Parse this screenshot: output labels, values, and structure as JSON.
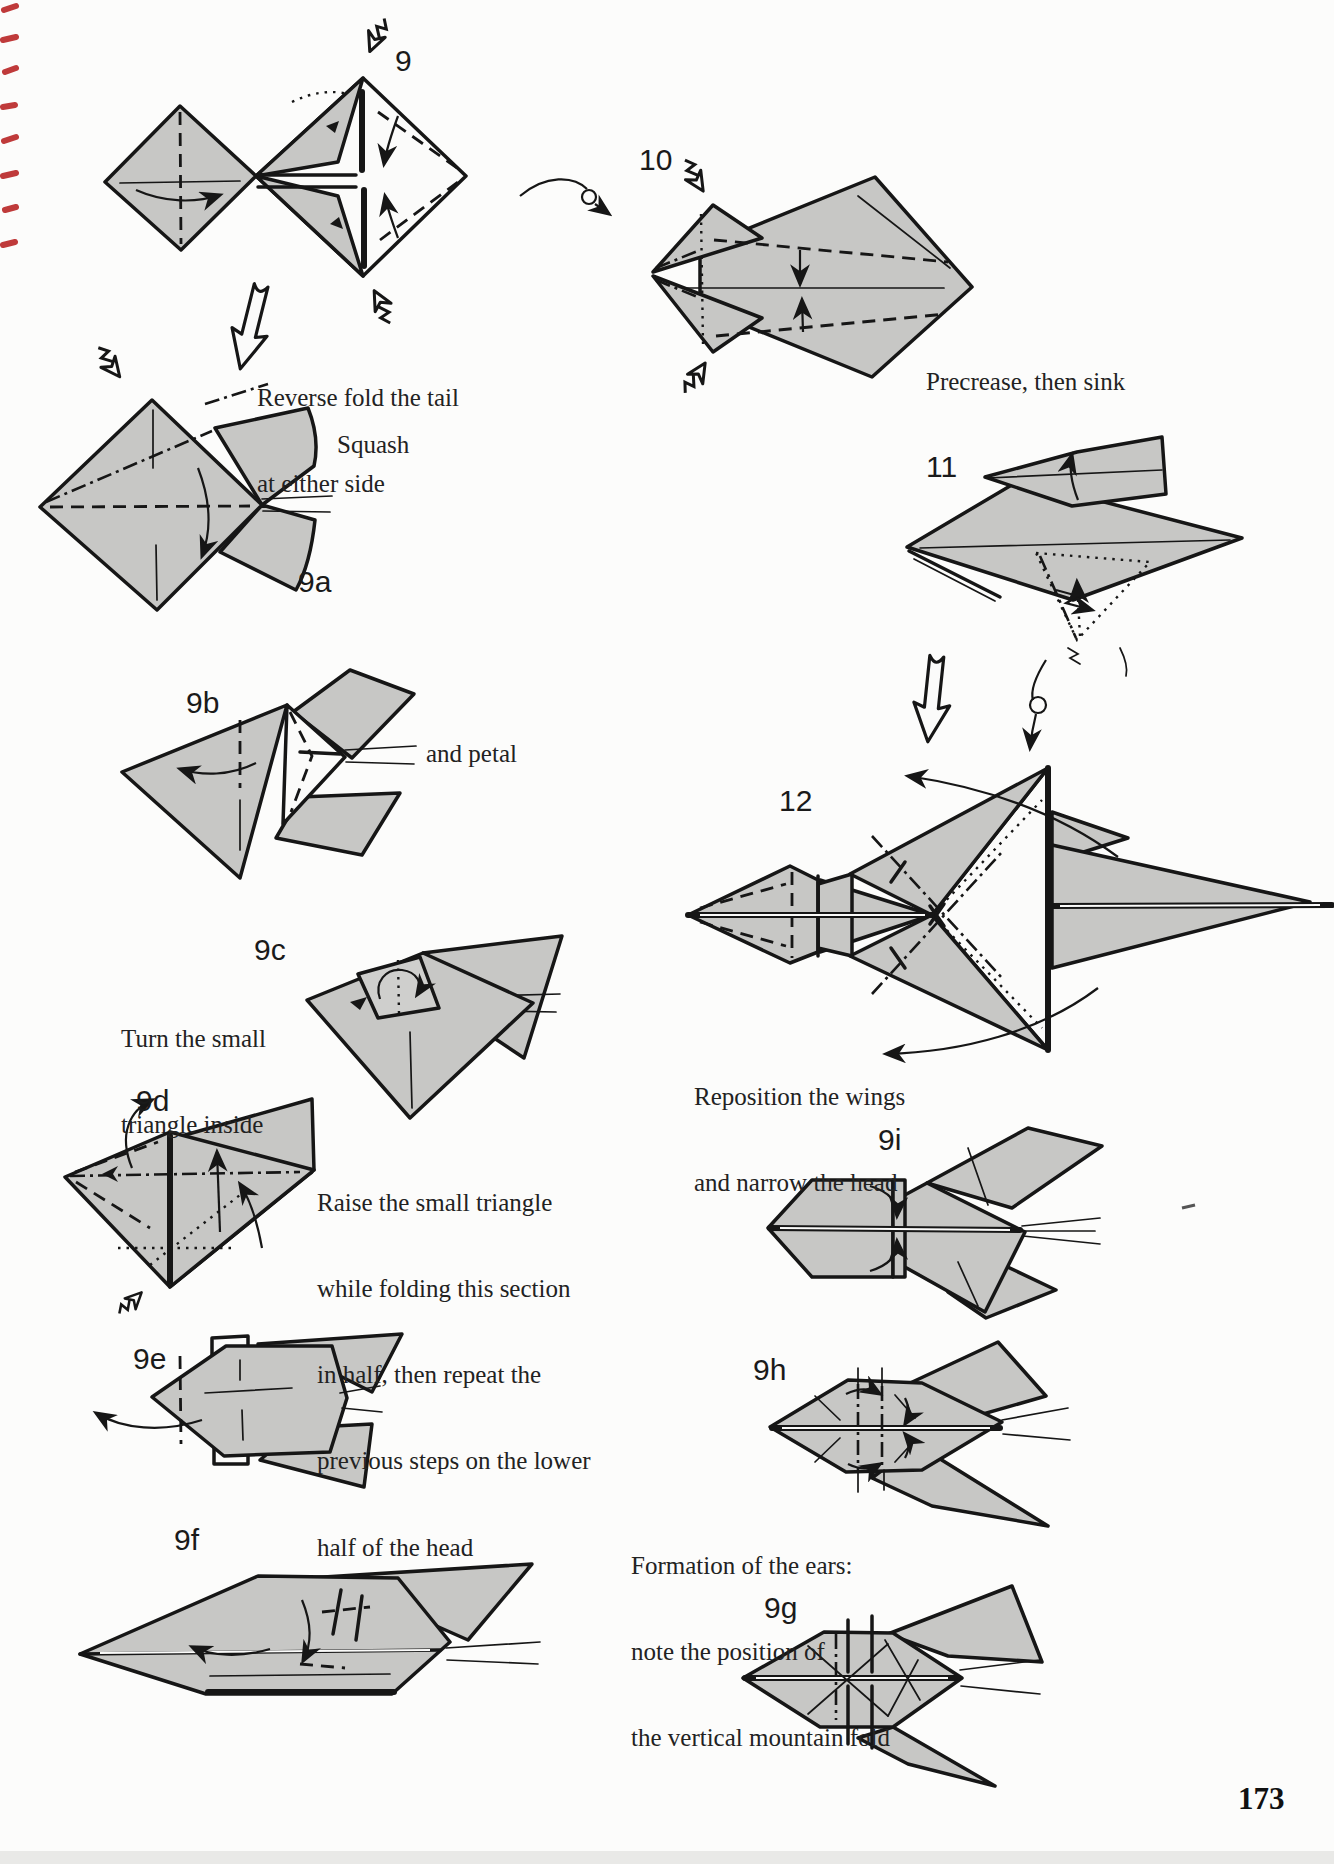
{
  "page": {
    "number": "173"
  },
  "colors": {
    "paper_gray": "#c7c7c5",
    "ink": "#161616",
    "scan_mark_red": "#bf3a3a"
  },
  "steps": {
    "s9": {
      "label": "9",
      "caption_lines": [
        "Reverse fold the tail",
        "at either side"
      ]
    },
    "s9a": {
      "label": "9a",
      "caption": "Squash"
    },
    "s9b": {
      "label": "9b",
      "caption": "and petal"
    },
    "s9c": {
      "label": "9c",
      "caption_lines": [
        "Turn the small",
        "triangle inside"
      ]
    },
    "s9d": {
      "label": "9d",
      "caption_lines": [
        "Raise the small triangle",
        "while folding this section",
        "in half, then repeat the",
        "previous steps on the lower",
        "half of the head"
      ]
    },
    "s9e": {
      "label": "9e"
    },
    "s9f": {
      "label": "9f"
    },
    "s9g": {
      "label": "9g"
    },
    "s9h": {
      "label": "9h",
      "caption_lines": [
        "Formation of the ears:",
        "note the position of",
        "the vertical mountain fold"
      ]
    },
    "s9i": {
      "label": "9i"
    },
    "s10": {
      "label": "10",
      "caption": "Precrease, then sink"
    },
    "s11": {
      "label": "11"
    },
    "s12": {
      "label": "12",
      "caption_lines": [
        "Reposition the wings",
        "and narrow the head"
      ]
    }
  }
}
